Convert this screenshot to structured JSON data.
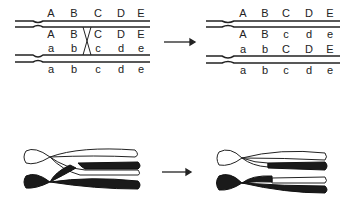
{
  "panels": {
    "before": {
      "pair1_top": [
        "A",
        "B",
        "C",
        "D",
        "E"
      ],
      "pair1_bottom": [
        "A",
        "B",
        "C",
        "D",
        "E"
      ],
      "pair2_top": [
        "a",
        "b",
        "c",
        "d",
        "e"
      ],
      "pair2_bottom": [
        "a",
        "b",
        "c",
        "d",
        "e"
      ],
      "crossover_between": [
        "B",
        "C"
      ]
    },
    "after": {
      "pair1_top": [
        "A",
        "B",
        "C",
        "D",
        "E"
      ],
      "pair1_bottom": [
        "A",
        "B",
        "c",
        "d",
        "e"
      ],
      "pair2_top": [
        "a",
        "b",
        "C",
        "D",
        "E"
      ],
      "pair2_bottom": [
        "a",
        "b",
        "c",
        "d",
        "e"
      ]
    }
  },
  "colors": {
    "line": "#222222",
    "paternal": "#ffffff",
    "maternal": "#1a1a1a"
  }
}
